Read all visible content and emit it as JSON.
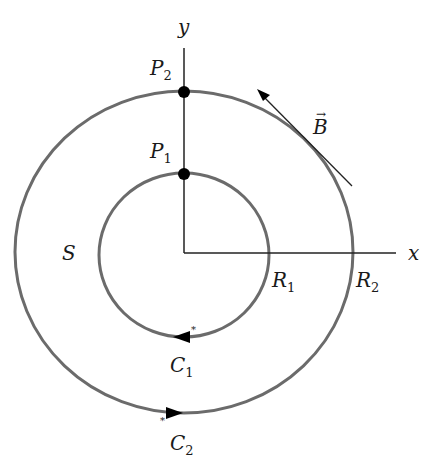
{
  "diagram": {
    "type": "concentric-circles-magnetic-field",
    "axes": {
      "x_label": "x",
      "y_label": "y"
    },
    "region_label": "S",
    "inner_circle": {
      "curve_label": "C",
      "curve_sub": "1",
      "radius_label": "R",
      "radius_sub": "1",
      "orientation": "clockwise"
    },
    "outer_circle": {
      "curve_label": "C",
      "curve_sub": "2",
      "radius_label": "R",
      "radius_sub": "2",
      "orientation": "counterclockwise"
    },
    "points": [
      {
        "label": "P",
        "sub": "2",
        "on": "outer_circle"
      },
      {
        "label": "P",
        "sub": "1",
        "on": "inner_circle"
      }
    ],
    "vector": {
      "label": "B",
      "decoration": "→",
      "direction": "tangent to outer circle, pointing up-left"
    },
    "colors": {
      "circle": "#6b6b6b",
      "axis": "#222222",
      "point": "#000000"
    }
  }
}
